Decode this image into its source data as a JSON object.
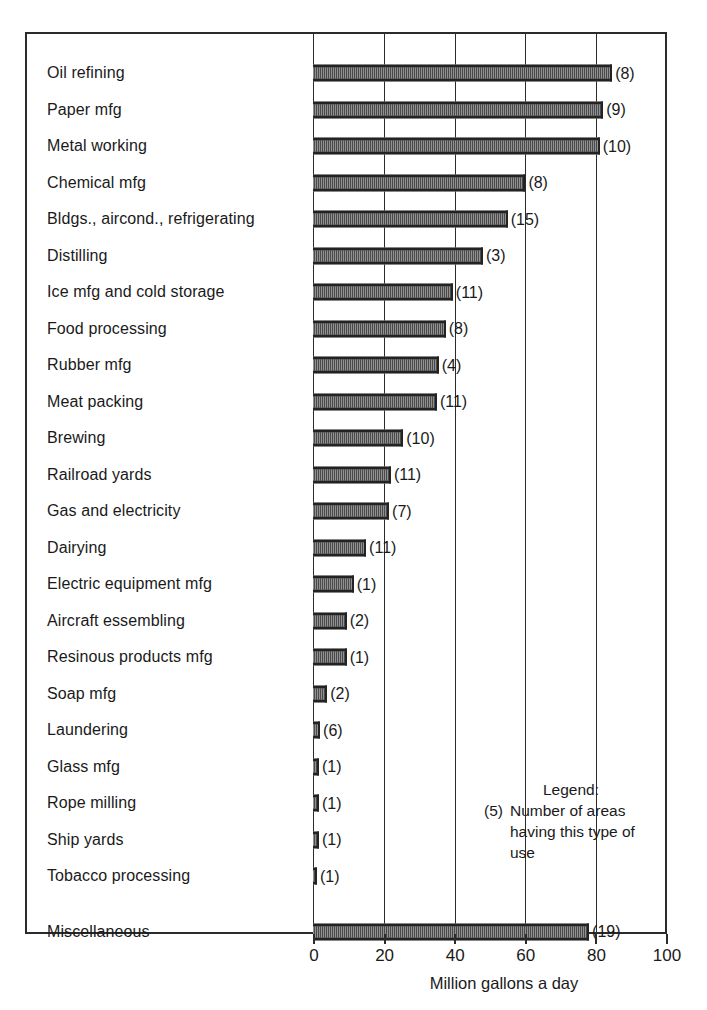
{
  "chart_data": {
    "type": "bar",
    "orientation": "horizontal",
    "title": "",
    "xlabel": "Million gallons a day",
    "ylabel": "",
    "xlim": [
      0,
      100
    ],
    "xticks": [
      0,
      20,
      40,
      60,
      80,
      100
    ],
    "xtick_labels": [
      "0",
      "20",
      "40",
      "60",
      "80",
      "100"
    ],
    "grid": true,
    "grid_axis": "x",
    "legend_position": "inside-lower-right",
    "value_label_format": "(n)",
    "value_label_meaning": "Number of areas having this type of use",
    "categories": [
      "Oil refining",
      "Paper mfg",
      "Metal working",
      "Chemical mfg",
      "Bldgs., aircond., refrigerating",
      "Distilling",
      "Ice mfg and cold storage",
      "Food processing",
      "Rubber mfg",
      "Meat packing",
      "Brewing",
      "Railroad yards",
      "Gas and electricity",
      "Dairying",
      "Electric equipment mfg",
      "Aircraft essembling",
      "Resinous products mfg",
      "Soap mfg",
      "Laundering",
      "Glass mfg",
      "Rope milling",
      "Ship yards",
      "Tobacco processing",
      "Miscellaneous"
    ],
    "values": [
      84.5,
      82.0,
      81.0,
      60.0,
      55.0,
      48.0,
      39.5,
      37.5,
      35.5,
      35.0,
      25.5,
      22.0,
      21.5,
      15.0,
      11.5,
      9.5,
      9.5,
      4.0,
      2.0,
      1.7,
      1.7,
      1.7,
      1.0,
      78.0
    ],
    "area_counts": [
      8,
      9,
      10,
      8,
      15,
      3,
      11,
      8,
      4,
      11,
      10,
      11,
      7,
      11,
      1,
      2,
      1,
      2,
      6,
      1,
      1,
      1,
      1,
      19
    ],
    "count_labels": [
      "(8)",
      "(9)",
      "(10)",
      "(8)",
      "(15)",
      "(3)",
      "(11)",
      "(8)",
      "(4)",
      "(11)",
      "(10)",
      "(11)",
      "(7)",
      "(11)",
      "(1)",
      "(2)",
      "(1)",
      "(2)",
      "(6)",
      "(1)",
      "(1)",
      "(1)",
      "(1)",
      "(19)"
    ],
    "series": [
      {
        "name": "Million gallons a day",
        "values": [
          84.5,
          82.0,
          81.0,
          60.0,
          55.0,
          48.0,
          39.5,
          37.5,
          35.5,
          35.0,
          25.5,
          22.0,
          21.5,
          15.0,
          11.5,
          9.5,
          9.5,
          4.0,
          2.0,
          1.7,
          1.7,
          1.7,
          1.0,
          78.0
        ]
      }
    ]
  },
  "legend": {
    "title": "Legend:",
    "key": "(5)",
    "text": "Number of areas having this type of use"
  },
  "axis": {
    "x_title": "Million gallons a day",
    "ticks": [
      "0",
      "20",
      "40",
      "60",
      "80",
      "100"
    ]
  },
  "style": {
    "bar_fill": "#d8d8d8",
    "bar_pattern": "#4a4a4a",
    "bar_border": "#232323",
    "frame_color": "#2b2b2b",
    "text_color": "#1a1a1a",
    "background": "#ffffff"
  }
}
